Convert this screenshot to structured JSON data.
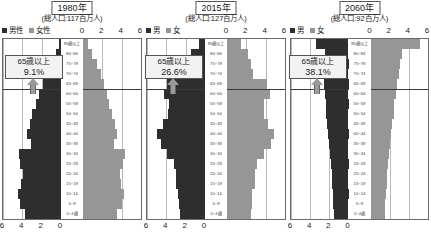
{
  "figure": {
    "legend_male_icon": "male-swatch-icon",
    "legend_female_icon": "female-swatch-icon"
  },
  "age_groups": [
    "85歳以上",
    "80~84",
    "75~79",
    "70~74",
    "65~69",
    "60~64",
    "55~59",
    "50~54",
    "45~49",
    "40~44",
    "35~39",
    "30~34",
    "25~29",
    "20~24",
    "15~19",
    "10~14",
    "5~9",
    "0~4歳"
  ],
  "axis": {
    "top_ticks": [
      "0",
      "2",
      "4",
      "6"
    ],
    "bottom_ticks": [
      "6",
      "4",
      "2",
      "0"
    ],
    "max": 6
  },
  "panels": [
    {
      "title": "1980年",
      "subtitle": "(総人口:117百万人)",
      "legend_male": "男性",
      "legend_female": "女性",
      "callout_line1": "65歳以上",
      "callout_line2": "9.1%",
      "elderly_share": "9.1%"
    },
    {
      "title": "2015年",
      "subtitle": "(総人口:127百万人)",
      "legend_male": "男",
      "legend_female": "女",
      "callout_line1": "65歳以上",
      "callout_line2": "26.6%",
      "elderly_share": "26.6%"
    },
    {
      "title": "2060年",
      "subtitle": "(総人口:92百万人)",
      "legend_male": "男",
      "legend_female": "女",
      "callout_line1": "65歳以上",
      "callout_line2": "38.1%",
      "elderly_share": "38.1%"
    }
  ],
  "chart_data": {
    "type": "bar",
    "chart_kind": "population-pyramid",
    "xlabel": "人口(百万人)",
    "ylabel": "年齢階級",
    "xlim": [
      0,
      6
    ],
    "grid": true,
    "units": "百万人",
    "categories": [
      "85歳以上",
      "80~84",
      "75~79",
      "70~74",
      "65~69",
      "60~64",
      "55~59",
      "50~54",
      "45~49",
      "40~44",
      "35~39",
      "30~34",
      "25~29",
      "20~24",
      "15~19",
      "10~14",
      "5~9",
      "0~4歳"
    ],
    "panels": [
      {
        "name": "1980年",
        "total_population": 117,
        "elderly_share_pct": 9.1,
        "series": [
          {
            "name": "男性",
            "side": "left",
            "color": "#2e2e2e",
            "values": [
              0.25,
              0.55,
              0.95,
              1.45,
              1.85,
              2.25,
              2.55,
              2.95,
              3.25,
              3.55,
              3.15,
              4.35,
              4.25,
              3.95,
              4.15,
              4.45,
              4.25,
              3.75
            ]
          },
          {
            "name": "女性",
            "side": "right",
            "color": "#969696",
            "values": [
              0.5,
              0.95,
              1.4,
              1.9,
              2.15,
              2.5,
              2.7,
              3.05,
              3.3,
              3.55,
              3.25,
              4.3,
              4.15,
              3.85,
              3.95,
              4.25,
              4.05,
              3.55
            ]
          }
        ]
      },
      {
        "name": "2015年",
        "total_population": 127,
        "elderly_share_pct": 26.6,
        "series": [
          {
            "name": "男",
            "side": "left",
            "color": "#2e2e2e",
            "values": [
              0.65,
              1.45,
              1.95,
              2.4,
              3.95,
              4.25,
              3.75,
              3.8,
              4.3,
              4.95,
              4.6,
              3.95,
              3.25,
              3.0,
              3.05,
              2.75,
              2.65,
              2.55
            ]
          },
          {
            "name": "女",
            "side": "right",
            "color": "#969696",
            "values": [
              1.45,
              2.15,
              2.45,
              2.7,
              4.15,
              4.4,
              3.85,
              3.85,
              4.25,
              4.85,
              4.5,
              3.85,
              3.15,
              2.9,
              2.9,
              2.6,
              2.55,
              2.45
            ]
          }
        ]
      },
      {
        "name": "2060年",
        "total_population": 92,
        "elderly_share_pct": 38.1,
        "series": [
          {
            "name": "男",
            "side": "left",
            "color": "#2e2e2e",
            "values": [
              3.35,
              2.45,
              2.55,
              2.6,
              2.55,
              2.5,
              2.4,
              2.3,
              2.2,
              2.1,
              2.0,
              1.9,
              1.8,
              1.75,
              1.7,
              1.65,
              1.6,
              1.55
            ]
          },
          {
            "name": "女",
            "side": "right",
            "color": "#969696",
            "values": [
              5.15,
              3.25,
              3.05,
              2.95,
              2.75,
              2.65,
              2.5,
              2.4,
              2.25,
              2.15,
              2.0,
              1.9,
              1.8,
              1.75,
              1.7,
              1.6,
              1.55,
              1.5
            ]
          }
        ]
      }
    ]
  }
}
